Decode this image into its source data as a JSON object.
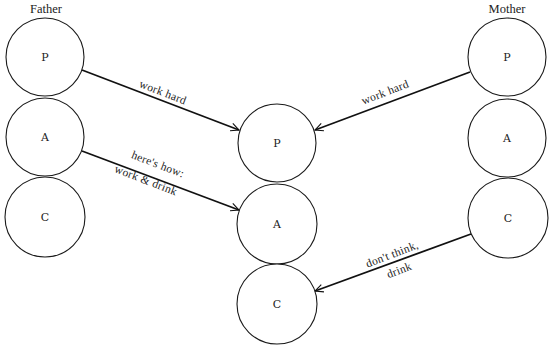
{
  "diagram": {
    "type": "transactional-analysis-script-matrix",
    "groups": {
      "father": {
        "title": "Father",
        "title_pos": [
          46,
          9
        ]
      },
      "mother": {
        "title": "Mother",
        "title_pos": [
          507,
          9
        ]
      },
      "child": {
        "title": ""
      }
    },
    "nodes": [
      {
        "id": "father-P",
        "label": "P",
        "cx": 45,
        "cy": 57,
        "r": 39
      },
      {
        "id": "father-A",
        "label": "A",
        "cx": 45,
        "cy": 137,
        "r": 39
      },
      {
        "id": "father-C",
        "label": "C",
        "cx": 45,
        "cy": 217,
        "r": 40
      },
      {
        "id": "child-P",
        "label": "P",
        "cx": 277,
        "cy": 143,
        "r": 39
      },
      {
        "id": "child-A",
        "label": "A",
        "cx": 277,
        "cy": 224,
        "r": 40
      },
      {
        "id": "child-C",
        "label": "C",
        "cx": 277,
        "cy": 304,
        "r": 40
      },
      {
        "id": "mother-P",
        "label": "P",
        "cx": 507,
        "cy": 57,
        "r": 39
      },
      {
        "id": "mother-A",
        "label": "A",
        "cx": 507,
        "cy": 138,
        "r": 39
      },
      {
        "id": "mother-C",
        "label": "C",
        "cx": 508,
        "cy": 218,
        "r": 40
      }
    ],
    "edges": [
      {
        "from": "father-P",
        "to": "child-P",
        "x1": 82,
        "y1": 70,
        "x2": 239,
        "y2": 130,
        "labels": [
          {
            "text": "work hard",
            "x": 163,
            "y": 92,
            "angle": 21
          }
        ]
      },
      {
        "from": "father-A",
        "to": "child-A",
        "x1": 82,
        "y1": 151,
        "x2": 239,
        "y2": 210,
        "labels": [
          {
            "text": "here's how:",
            "x": 158,
            "y": 164,
            "angle": 21
          },
          {
            "text": "work & drink",
            "x": 146,
            "y": 180,
            "angle": 21
          }
        ]
      },
      {
        "from": "mother-P",
        "to": "child-P",
        "x1": 470,
        "y1": 72,
        "x2": 315,
        "y2": 130,
        "labels": [
          {
            "text": "work hard",
            "x": 385,
            "y": 92,
            "angle": -21
          }
        ]
      },
      {
        "from": "mother-C",
        "to": "child-C",
        "x1": 471,
        "y1": 234,
        "x2": 315,
        "y2": 291,
        "labels": [
          {
            "text": "don't think,",
            "x": 392,
            "y": 254,
            "angle": -21
          },
          {
            "text": "drink",
            "x": 399,
            "y": 270,
            "angle": -21
          }
        ]
      }
    ]
  }
}
